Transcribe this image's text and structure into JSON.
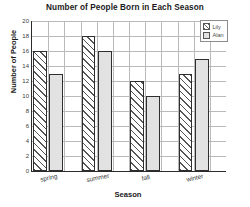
{
  "chart_data": {
    "type": "bar",
    "title": "Number of People Born in Each Season",
    "xlabel": "Season",
    "ylabel": "Number of People",
    "categories": [
      "spring",
      "summer",
      "fall",
      "winter"
    ],
    "series": [
      {
        "name": "Lily",
        "values": [
          16,
          18,
          12,
          13
        ],
        "fill": "hatched",
        "color": "#ffffff"
      },
      {
        "name": "Alan",
        "values": [
          13,
          16,
          10,
          15
        ],
        "fill": "solid",
        "color": "#e2e2e2"
      }
    ],
    "ylim": [
      0,
      20
    ],
    "ytick_labels": [
      "0",
      "2",
      "4",
      "6",
      "8",
      "10",
      "12",
      "14",
      "16",
      "18",
      "20"
    ],
    "ytick_values": [
      0,
      2,
      4,
      6,
      8,
      10,
      12,
      14,
      16,
      18,
      20
    ],
    "grid": true,
    "legend_position": "top-right"
  },
  "legend": {
    "entries": [
      {
        "label": "Lily"
      },
      {
        "label": "Alan"
      }
    ]
  }
}
